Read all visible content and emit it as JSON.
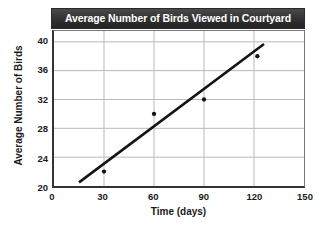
{
  "chart_data": {
    "type": "scatter",
    "title": "Average Number of Birds Viewed in Courtyard",
    "xlabel": "Time (days)",
    "ylabel": "Average Number of Birds",
    "xlim": [
      0,
      150
    ],
    "ylim": [
      20,
      41.5
    ],
    "xticks": [
      0,
      30,
      60,
      90,
      120,
      150
    ],
    "yticks": [
      20,
      24,
      28,
      32,
      36,
      40
    ],
    "xtick_labels": [
      "0",
      "30",
      "60",
      "90",
      "120",
      "150"
    ],
    "ytick_labels": [
      "20",
      "24",
      "28",
      "32",
      "36",
      "40"
    ],
    "grid": true,
    "legend": "none",
    "points": [
      {
        "x": 30,
        "y": 22
      },
      {
        "x": 60,
        "y": 30
      },
      {
        "x": 90,
        "y": 32
      },
      {
        "x": 122,
        "y": 38
      }
    ],
    "trend_line": {
      "name": "line of best fit",
      "x_start": 15,
      "y_start": 20.5,
      "x_end": 126,
      "y_end": 39.7
    },
    "colors": {
      "title_bar_background": "#2f2f2f",
      "title_text": "#ffffff",
      "grid": "#b9b9b9",
      "axis": "#333333",
      "marker": "#141414",
      "trend_line": "#141414",
      "plot_background": "#ffffff"
    }
  }
}
